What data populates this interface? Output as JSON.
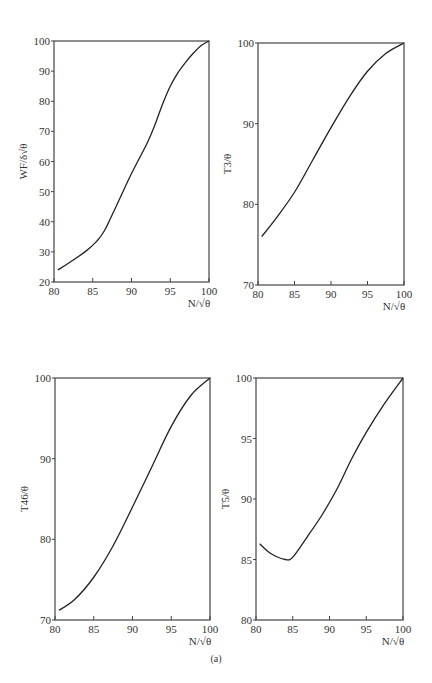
{
  "caption": "(a)",
  "chart_data": [
    {
      "type": "line",
      "id": "chart-wf",
      "title": "",
      "xlabel": "N/√θ",
      "ylabel": "WF/δ√θ",
      "xlim": [
        80,
        100
      ],
      "ylim": [
        20,
        100
      ],
      "xticks": [
        "80",
        "85",
        "90",
        "95",
        "100"
      ],
      "yticks": [
        "20",
        "30",
        "40",
        "50",
        "60",
        "70",
        "80",
        "90",
        "100"
      ],
      "grid": false,
      "series": [
        {
          "name": "WF/δ√θ",
          "x": [
            80.5,
            82,
            84,
            85.5,
            86.5,
            88,
            90,
            92,
            93,
            94,
            95,
            96,
            97,
            98,
            99,
            100
          ],
          "y": [
            24,
            26.5,
            30,
            33.5,
            37,
            45,
            56,
            66,
            72,
            79,
            85,
            89.5,
            93,
            96,
            98.5,
            100
          ]
        }
      ]
    },
    {
      "type": "line",
      "id": "chart-t3",
      "title": "",
      "xlabel": "N/√θ",
      "ylabel": "T3/θ",
      "xlim": [
        80,
        100
      ],
      "ylim": [
        70,
        100
      ],
      "xticks": [
        "80",
        "85",
        "90",
        "95",
        "100"
      ],
      "yticks": [
        "70",
        "80",
        "90",
        "100"
      ],
      "grid": false,
      "series": [
        {
          "name": "T3/θ",
          "x": [
            80.5,
            82.5,
            85,
            87.5,
            90,
            92.5,
            95,
            97.5,
            100
          ],
          "y": [
            76,
            78.3,
            81.5,
            85.5,
            89.5,
            93.3,
            96.5,
            98.7,
            100
          ]
        }
      ]
    },
    {
      "type": "line",
      "id": "chart-t46",
      "title": "",
      "xlabel": "N/√θ",
      "ylabel": "T46/θ",
      "xlim": [
        80,
        100
      ],
      "ylim": [
        70,
        100
      ],
      "xticks": [
        "80",
        "85",
        "90",
        "95",
        "100"
      ],
      "yticks": [
        "70",
        "80",
        "90",
        "100"
      ],
      "grid": false,
      "series": [
        {
          "name": "T46/θ",
          "x": [
            80.5,
            82.5,
            85,
            87.5,
            90,
            92.5,
            95,
            97.5,
            100
          ],
          "y": [
            71.2,
            72.5,
            75.3,
            79.2,
            84,
            89,
            94,
            97.8,
            100
          ]
        }
      ]
    },
    {
      "type": "line",
      "id": "chart-t5",
      "title": "",
      "xlabel": "N/√θ",
      "ylabel": "T5/θ",
      "xlim": [
        80,
        100
      ],
      "ylim": [
        80,
        100
      ],
      "xticks": [
        "80",
        "85",
        "90",
        "95",
        "100"
      ],
      "yticks": [
        "80",
        "85",
        "90",
        "95",
        "100"
      ],
      "grid": false,
      "series": [
        {
          "name": "T5/θ",
          "x": [
            80.5,
            82,
            84,
            85,
            87,
            89,
            91,
            93,
            95,
            97.5,
            100
          ],
          "y": [
            86.3,
            85.5,
            85.0,
            85.2,
            86.9,
            88.7,
            90.8,
            93.3,
            95.5,
            97.9,
            100
          ]
        }
      ]
    }
  ]
}
